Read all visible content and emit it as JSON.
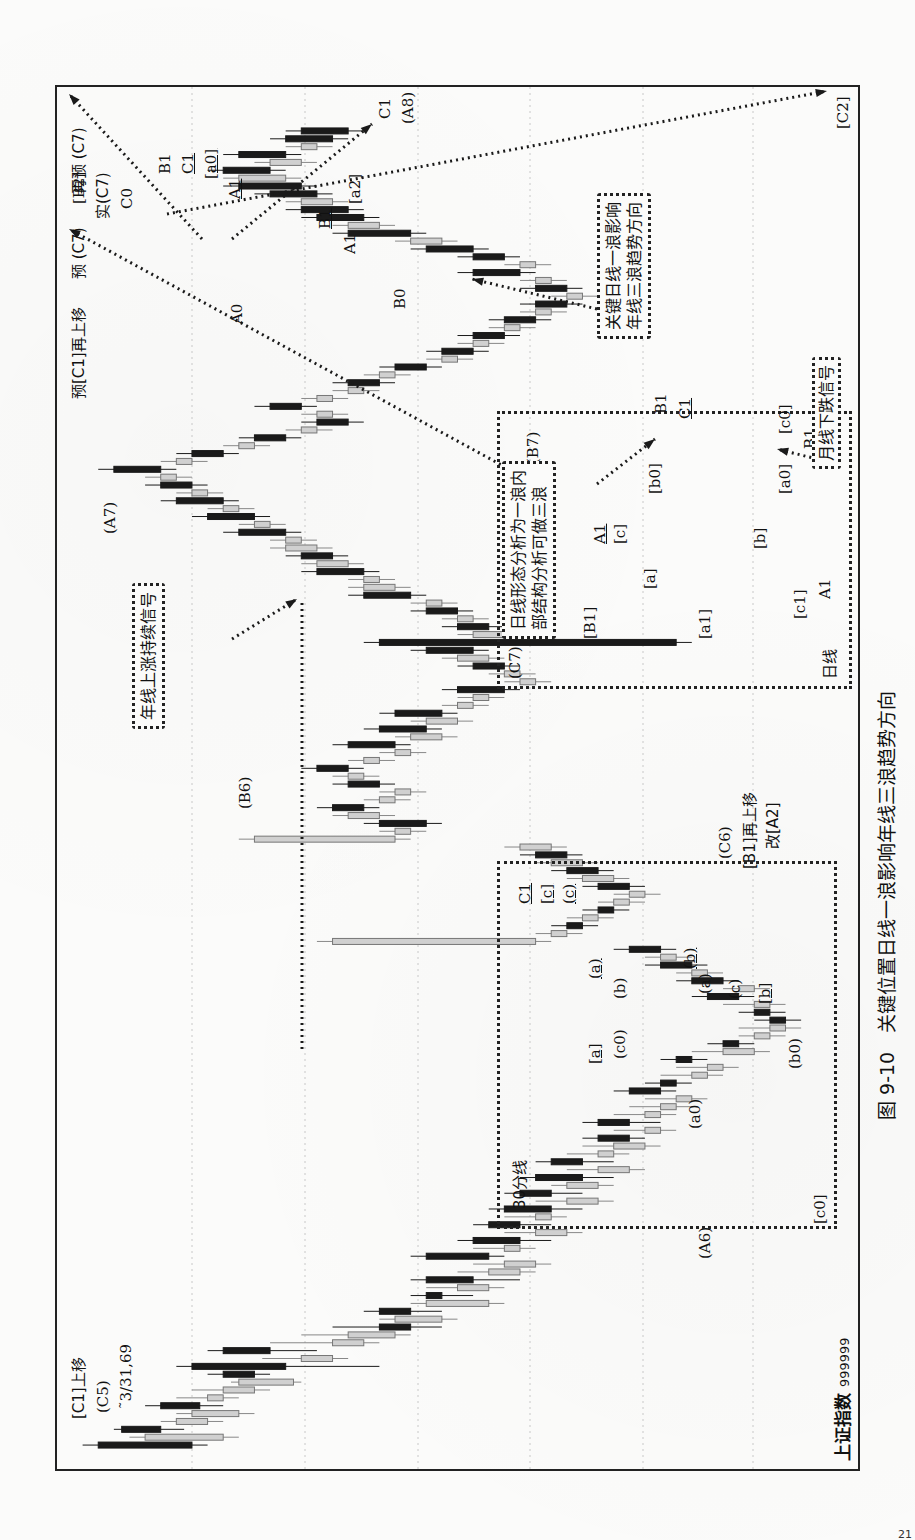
{
  "figure": {
    "caption": "图 9-10　关键位置日线一浪影响年线三浪趋势方向",
    "index_name": "上证指数",
    "index_code": "999999",
    "start_date": "˜3/31,69",
    "page_number": "21"
  },
  "annotations": {
    "top_left_c1": "[C1]上移",
    "top_left_c5": "(C5)",
    "a6": "(A6)",
    "b6": "(B6)",
    "a7": "(A7)",
    "c6": "(C6)",
    "b1_move": "[B1]再上移",
    "gai_a2": "改[A2]",
    "yu_c1_move": "预[C1]再上移",
    "yu_c7": "预 (C7)",
    "b2": "[B2]",
    "shi_c7": "实(C7)",
    "c0": "C0",
    "zai_yu_c7": "再预 (C7)",
    "b1": "B1",
    "c1": "C1",
    "a0_brk": "[a0]",
    "a1_u": "A1",
    "b1_u": "B1",
    "a2_brk": "[a2]",
    "c1_a8_c": "C1",
    "a8": "(A8)",
    "c2": "[C2]",
    "a0": "A0",
    "b0": "B0",
    "a1": "A1",
    "b7": "(B7)"
  },
  "notes": {
    "yearly_signal": "年线上涨持续信号",
    "key_daily_line1": "关键日线一浪影响",
    "key_daily_line2": "年线三浪趋势方向",
    "daily_inner_line1": "日线形态分析为一浪内",
    "daily_inner_line2": "部结构分析可做三浪",
    "monthly_down": "月线下跌信号"
  },
  "inset_daily": {
    "title": "日线",
    "labels": {
      "c7": "(C7)",
      "B1": "[B1]",
      "a1": "[a1]",
      "a": "[a]",
      "c1": "[c1]",
      "A1_low": "A1",
      "A1_u": "A1",
      "c": "[c]",
      "b": "[b]",
      "b0": "[b0]",
      "a0": "[a0]",
      "c0": "[c0]",
      "B1_u": "B1",
      "a2": "[a2]",
      "B1_top": "B1",
      "C1_u": "C1"
    }
  },
  "inset_30min": {
    "title": "30分线",
    "labels": {
      "C1": "C1",
      "c_brk": "[c]",
      "c_par": "(c)",
      "a_par_u": "(a)",
      "a_brk_u": "[a]",
      "b_par": "(b)",
      "c0_par": "(c0)",
      "b_par_u": "(b)",
      "a_par": "(a)",
      "c_par2": "(c)",
      "b_brk_u": "[b]",
      "a0_par": "(a0)",
      "b0_par": "(b0)",
      "c0_brk": "[c0]"
    }
  },
  "colors": {
    "ink": "#1a1a1a",
    "gray_candle": "#9a9a9a",
    "grid": "#c8c8c8"
  },
  "chart_data": {
    "type": "candlestick",
    "orientation": "time axis runs bottom→top on page; price increases right→left",
    "xlabel": "time (monthly bars)",
    "ylabel": "price",
    "grid": true,
    "series_note": "OHLC approximated in normalized price units 0-100 (100 = top of frame); fill: b=black (down), g=gray (up)",
    "candles": [
      [
        96,
        98,
        82,
        84,
        "b"
      ],
      [
        90,
        92,
        78,
        80,
        "g"
      ],
      [
        88,
        94,
        85,
        93,
        "b"
      ],
      [
        86,
        88,
        80,
        82,
        "g"
      ],
      [
        84,
        86,
        76,
        78,
        "g"
      ],
      [
        83,
        90,
        80,
        88,
        "b"
      ],
      [
        82,
        86,
        78,
        80,
        "g"
      ],
      [
        80,
        84,
        74,
        76,
        "g"
      ],
      [
        78,
        79,
        70,
        71,
        "g"
      ],
      [
        76,
        82,
        74,
        80,
        "b"
      ],
      [
        72,
        86,
        60,
        84,
        "b"
      ],
      [
        70,
        75,
        64,
        66,
        "g"
      ],
      [
        74,
        82,
        68,
        80,
        "b"
      ],
      [
        66,
        74,
        60,
        62,
        "g"
      ],
      [
        64,
        70,
        56,
        58,
        "g"
      ],
      [
        60,
        66,
        52,
        56,
        "b"
      ],
      [
        58,
        60,
        50,
        52,
        "g"
      ],
      [
        56,
        62,
        52,
        60,
        "b"
      ],
      [
        54,
        56,
        44,
        46,
        "g"
      ],
      [
        52,
        56,
        48,
        54,
        "b"
      ],
      [
        50,
        54,
        44,
        46,
        "g"
      ],
      [
        48,
        56,
        42,
        54,
        "b"
      ],
      [
        46,
        50,
        40,
        42,
        "g"
      ],
      [
        44,
        48,
        38,
        40,
        "g"
      ],
      [
        46,
        56,
        44,
        54,
        "b"
      ],
      [
        44,
        48,
        40,
        42,
        "g"
      ],
      [
        42,
        50,
        38,
        48,
        "b"
      ],
      [
        40,
        44,
        34,
        36,
        "g"
      ],
      [
        42,
        48,
        38,
        46,
        "b"
      ],
      [
        40,
        44,
        36,
        38,
        "g"
      ],
      [
        38,
        46,
        34,
        44,
        "b"
      ],
      [
        36,
        40,
        30,
        32,
        "g"
      ],
      [
        38,
        44,
        34,
        42,
        "b"
      ],
      [
        36,
        38,
        30,
        32,
        "g"
      ],
      [
        34,
        42,
        30,
        40,
        "b"
      ],
      [
        32,
        36,
        26,
        28,
        "g"
      ],
      [
        34,
        40,
        30,
        38,
        "b"
      ],
      [
        32,
        36,
        28,
        30,
        "g"
      ],
      [
        30,
        34,
        24,
        26,
        "g"
      ],
      [
        28,
        34,
        26,
        32,
        "b"
      ],
      [
        26,
        30,
        22,
        24,
        "g"
      ],
      [
        28,
        34,
        24,
        32,
        "b"
      ],
      [
        26,
        30,
        22,
        24,
        "g"
      ],
      [
        24,
        28,
        20,
        22,
        "g"
      ],
      [
        22,
        26,
        18,
        20,
        "g"
      ],
      [
        24,
        30,
        22,
        28,
        "b"
      ],
      [
        22,
        26,
        20,
        24,
        "b"
      ],
      [
        20,
        24,
        16,
        18,
        "g"
      ],
      [
        18,
        22,
        14,
        16,
        "g"
      ],
      [
        20,
        24,
        18,
        22,
        "b"
      ],
      [
        16,
        20,
        10,
        12,
        "g"
      ],
      [
        14,
        18,
        12,
        16,
        "b"
      ],
      [
        12,
        14,
        8,
        10,
        "g"
      ],
      [
        10,
        14,
        6,
        8,
        "g"
      ],
      [
        8,
        12,
        6,
        10,
        "b"
      ],
      [
        10,
        14,
        8,
        12,
        "b"
      ],
      [
        12,
        16,
        8,
        10,
        "g"
      ],
      [
        14,
        20,
        12,
        18,
        "b"
      ],
      [
        12,
        16,
        10,
        14,
        "g"
      ],
      [
        16,
        22,
        14,
        20,
        "b"
      ],
      [
        18,
        22,
        16,
        20,
        "g"
      ],
      [
        20,
        26,
        18,
        24,
        "b"
      ],
      [
        22,
        26,
        20,
        24,
        "g"
      ],
      [
        24,
        30,
        22,
        28,
        "b"
      ],
      [
        40,
        68,
        38,
        66,
        "g"
      ],
      [
        36,
        40,
        34,
        38,
        "g"
      ],
      [
        34,
        38,
        32,
        36,
        "b"
      ],
      [
        32,
        36,
        30,
        34,
        "g"
      ],
      [
        30,
        34,
        28,
        32,
        "b"
      ],
      [
        28,
        32,
        26,
        30,
        "g"
      ],
      [
        26,
        30,
        24,
        28,
        "g"
      ],
      [
        28,
        34,
        26,
        32,
        "b"
      ],
      [
        30,
        36,
        28,
        34,
        "g"
      ],
      [
        32,
        38,
        30,
        36,
        "b"
      ],
      [
        34,
        40,
        32,
        38,
        "g"
      ],
      [
        36,
        42,
        34,
        40,
        "b"
      ],
      [
        38,
        44,
        36,
        42,
        "g"
      ],
      [
        58,
        78,
        56,
        76,
        "g"
      ],
      [
        56,
        60,
        54,
        58,
        "g"
      ],
      [
        54,
        62,
        52,
        60,
        "b"
      ],
      [
        60,
        66,
        58,
        64,
        "g"
      ],
      [
        62,
        68,
        60,
        66,
        "b"
      ],
      [
        58,
        62,
        56,
        60,
        "g"
      ],
      [
        56,
        60,
        54,
        58,
        "g"
      ],
      [
        60,
        66,
        58,
        64,
        "b"
      ],
      [
        62,
        66,
        60,
        64,
        "g"
      ],
      [
        64,
        70,
        62,
        68,
        "b"
      ],
      [
        60,
        64,
        58,
        62,
        "g"
      ],
      [
        56,
        60,
        54,
        58,
        "g"
      ],
      [
        58,
        66,
        56,
        64,
        "b"
      ],
      [
        52,
        58,
        50,
        56,
        "g"
      ],
      [
        54,
        62,
        52,
        60,
        "b"
      ],
      [
        50,
        56,
        48,
        54,
        "g"
      ],
      [
        52,
        60,
        50,
        58,
        "b"
      ],
      [
        48,
        52,
        46,
        50,
        "g"
      ],
      [
        46,
        50,
        44,
        48,
        "g"
      ],
      [
        44,
        52,
        42,
        50,
        "b"
      ],
      [
        40,
        44,
        38,
        42,
        "g"
      ],
      [
        42,
        46,
        40,
        44,
        "g"
      ],
      [
        44,
        50,
        42,
        48,
        "b"
      ],
      [
        46,
        52,
        44,
        50,
        "g"
      ],
      [
        48,
        56,
        46,
        54,
        "b"
      ],
      [
        22,
        62,
        20,
        60,
        "b"
      ],
      [
        40,
        50,
        38,
        48,
        "g"
      ],
      [
        46,
        52,
        44,
        50,
        "b"
      ],
      [
        48,
        52,
        46,
        50,
        "g"
      ],
      [
        50,
        56,
        48,
        54,
        "b"
      ],
      [
        52,
        56,
        50,
        54,
        "g"
      ],
      [
        56,
        64,
        54,
        62,
        "b"
      ],
      [
        58,
        64,
        56,
        62,
        "g"
      ],
      [
        60,
        64,
        58,
        62,
        "g"
      ],
      [
        62,
        70,
        60,
        68,
        "b"
      ],
      [
        64,
        70,
        62,
        68,
        "g"
      ],
      [
        66,
        72,
        64,
        70,
        "b"
      ],
      [
        68,
        74,
        66,
        72,
        "g"
      ],
      [
        70,
        74,
        68,
        72,
        "g"
      ],
      [
        72,
        80,
        70,
        78,
        "b"
      ],
      [
        74,
        78,
        72,
        76,
        "g"
      ],
      [
        76,
        84,
        74,
        82,
        "b"
      ],
      [
        78,
        82,
        76,
        80,
        "g"
      ],
      [
        80,
        88,
        78,
        86,
        "b"
      ],
      [
        82,
        86,
        80,
        84,
        "g"
      ],
      [
        84,
        90,
        82,
        88,
        "b"
      ],
      [
        86,
        90,
        84,
        88,
        "g"
      ],
      [
        88,
        96,
        86,
        94,
        "b"
      ],
      [
        84,
        88,
        82,
        86,
        "g"
      ],
      [
        80,
        86,
        78,
        84,
        "b"
      ],
      [
        76,
        80,
        74,
        78,
        "g"
      ],
      [
        72,
        78,
        70,
        76,
        "b"
      ],
      [
        68,
        72,
        66,
        70,
        "g"
      ],
      [
        64,
        70,
        62,
        68,
        "b"
      ],
      [
        66,
        70,
        64,
        68,
        "g"
      ],
      [
        70,
        76,
        68,
        74,
        "b"
      ],
      [
        66,
        70,
        64,
        68,
        "g"
      ],
      [
        62,
        66,
        60,
        64,
        "g"
      ],
      [
        60,
        66,
        58,
        64,
        "b"
      ],
      [
        58,
        62,
        56,
        60,
        "g"
      ],
      [
        54,
        60,
        52,
        58,
        "b"
      ],
      [
        50,
        54,
        48,
        52,
        "g"
      ],
      [
        48,
        54,
        46,
        52,
        "b"
      ],
      [
        46,
        50,
        44,
        48,
        "g"
      ],
      [
        44,
        50,
        42,
        48,
        "b"
      ],
      [
        42,
        46,
        40,
        44,
        "g"
      ],
      [
        40,
        46,
        38,
        44,
        "b"
      ],
      [
        38,
        42,
        36,
        40,
        "g"
      ],
      [
        36,
        42,
        34,
        40,
        "b"
      ],
      [
        34,
        38,
        32,
        36,
        "g"
      ],
      [
        36,
        42,
        34,
        40,
        "b"
      ],
      [
        38,
        42,
        36,
        40,
        "g"
      ],
      [
        42,
        50,
        40,
        48,
        "b"
      ],
      [
        40,
        44,
        38,
        42,
        "g"
      ],
      [
        44,
        50,
        42,
        48,
        "b"
      ],
      [
        48,
        56,
        46,
        54,
        "b"
      ],
      [
        52,
        58,
        50,
        56,
        "g"
      ],
      [
        56,
        66,
        54,
        64,
        "b"
      ],
      [
        60,
        66,
        58,
        64,
        "g"
      ],
      [
        62,
        70,
        60,
        68,
        "b"
      ],
      [
        64,
        72,
        62,
        70,
        "b"
      ],
      [
        66,
        72,
        64,
        70,
        "g"
      ],
      [
        68,
        76,
        66,
        74,
        "b"
      ],
      [
        70,
        80,
        68,
        78,
        "b"
      ],
      [
        72,
        80,
        70,
        78,
        "g"
      ],
      [
        74,
        82,
        72,
        80,
        "b"
      ],
      [
        70,
        76,
        68,
        74,
        "g"
      ],
      [
        72,
        80,
        70,
        78,
        "b"
      ],
      [
        68,
        72,
        66,
        70,
        "g"
      ],
      [
        66,
        74,
        64,
        72,
        "b"
      ],
      [
        64,
        72,
        62,
        70,
        "b"
      ]
    ]
  }
}
